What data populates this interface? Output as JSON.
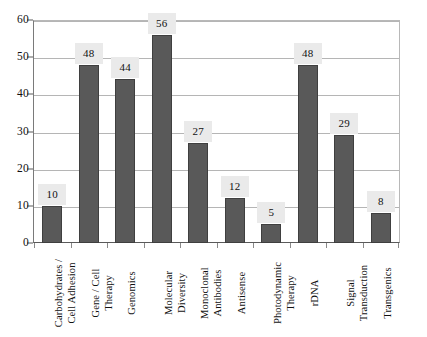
{
  "chart_data": {
    "type": "bar",
    "title": "",
    "xlabel": "",
    "ylabel": "",
    "ylim": [
      0,
      60
    ],
    "ytick_step": 10,
    "yticks": [
      0,
      10,
      20,
      30,
      40,
      50,
      60
    ],
    "grid": true,
    "legend": false,
    "data_labels": true,
    "categories": [
      "Carbohydrates / Cell Adhesion",
      "Gene / Cell Therapy",
      "Genomics",
      "Molecular Diversity",
      "Monoclonal Antibodies",
      "Antisense",
      "Photodynamic Therapy",
      "rDNA",
      "Signal Transduction",
      "Transgenics"
    ],
    "category_lines": [
      [
        "Carbohydrates /",
        "Cell Adhesion"
      ],
      [
        "Gene / Cell",
        "Therapy"
      ],
      [
        "Genomics"
      ],
      [
        "Molecular",
        "Diversity"
      ],
      [
        "Monoclonal",
        "Antibodies"
      ],
      [
        "Antisense"
      ],
      [
        "Photodynamic",
        "Therapy"
      ],
      [
        "rDNA"
      ],
      [
        "Signal",
        "Transduction"
      ],
      [
        "Transgenics"
      ]
    ],
    "values": [
      10,
      48,
      44,
      56,
      27,
      12,
      5,
      48,
      29,
      8
    ],
    "value_labels": [
      "10",
      "48",
      "44",
      "56",
      "27",
      "12",
      "5",
      "48",
      "29",
      "8"
    ],
    "bar_color": "#595959",
    "bar_border_color": "#3f3f3f",
    "label_box_color": "#eaeaea",
    "gridline_color": "#b5b5b5",
    "axis_color": "#5a5a5a",
    "background": "#ffffff"
  },
  "axis": {
    "y_tick_labels": [
      "60",
      "50",
      "40",
      "30",
      "20",
      "10",
      "0"
    ]
  }
}
